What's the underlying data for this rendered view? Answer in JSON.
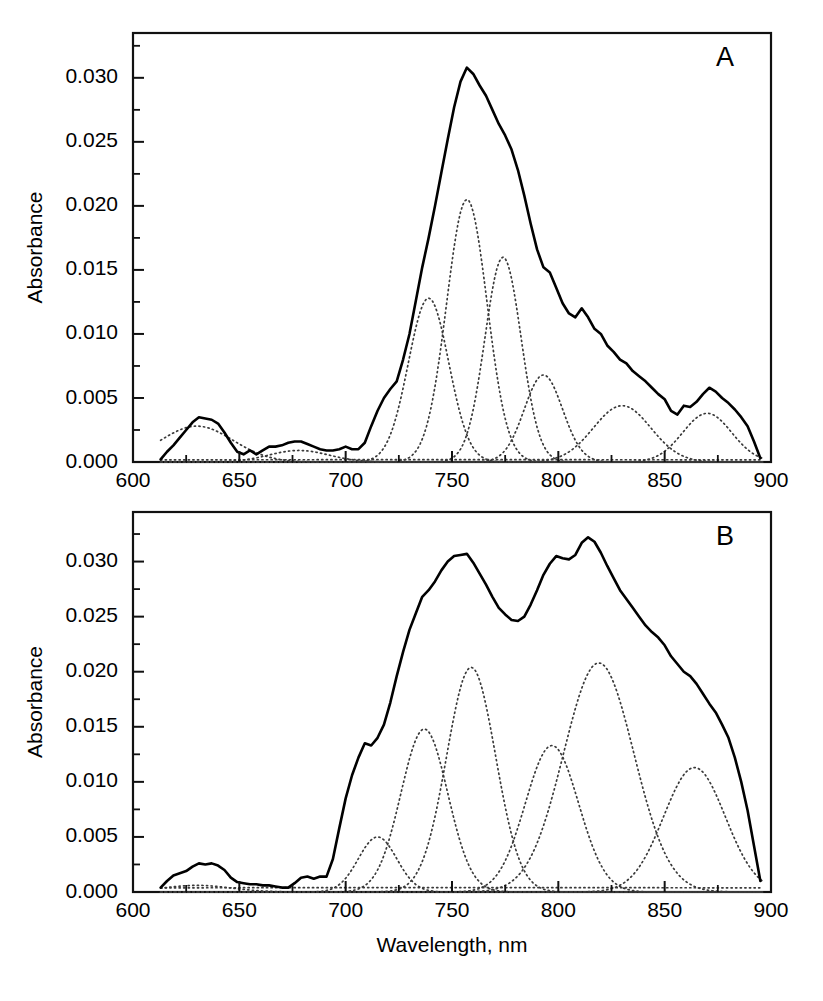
{
  "figure": {
    "background": "#ffffff",
    "width": 823,
    "height": 1001,
    "shared_xlabel": "Wavelength, nm",
    "shared_ylabel": "Absorbance"
  },
  "chart_data": [
    {
      "id": "panel-a",
      "type": "line",
      "title": "",
      "panel_label": "A",
      "xlabel": "",
      "ylabel": "Absorbance",
      "xlim": [
        600,
        900
      ],
      "ylim": [
        0.0,
        0.0335
      ],
      "grid": false,
      "legend": "none",
      "xticks": [
        600,
        650,
        700,
        750,
        800,
        850,
        900
      ],
      "xticklabels": [
        "600",
        "650",
        "700",
        "750",
        "800",
        "850",
        "900"
      ],
      "xminorticks": [
        625,
        675,
        725,
        775,
        825,
        875
      ],
      "yticks": [
        0.0,
        0.005,
        0.01,
        0.015,
        0.02,
        0.025,
        0.03
      ],
      "yticklabels": [
        "0.000",
        "0.005",
        "0.010",
        "0.015",
        "0.020",
        "0.025",
        "0.030"
      ],
      "yminorticks": [
        0.0025,
        0.0075,
        0.0125,
        0.0175,
        0.0225,
        0.0275,
        0.0325
      ],
      "series": [
        {
          "name": "measured spectrum",
          "style": "solid",
          "color": "#000000",
          "x": [
            613,
            616,
            619,
            622,
            625,
            628,
            631,
            634,
            637,
            640,
            643,
            646,
            649,
            652,
            655,
            658,
            661,
            664,
            667,
            670,
            673,
            676,
            679,
            682,
            685,
            688,
            691,
            694,
            697,
            700,
            703,
            706,
            709,
            712,
            715,
            718,
            721,
            724,
            727,
            730,
            733,
            736,
            739,
            742,
            745,
            748,
            751,
            754,
            757,
            760,
            763,
            766,
            769,
            772,
            775,
            778,
            781,
            784,
            787,
            790,
            793,
            796,
            799,
            802,
            805,
            808,
            811,
            814,
            817,
            820,
            823,
            826,
            829,
            832,
            835,
            838,
            841,
            844,
            847,
            850,
            853,
            856,
            859,
            862,
            865,
            868,
            871,
            874,
            877,
            880,
            883,
            886,
            889,
            892,
            895
          ],
          "y": [
            0.0002,
            0.0008,
            0.0013,
            0.0019,
            0.0025,
            0.0031,
            0.0035,
            0.0034,
            0.0033,
            0.003,
            0.0023,
            0.0015,
            0.0008,
            0.0006,
            0.0009,
            0.0006,
            0.0009,
            0.0012,
            0.0012,
            0.0013,
            0.0015,
            0.0016,
            0.0016,
            0.0014,
            0.0012,
            0.001,
            0.0009,
            0.0009,
            0.001,
            0.0012,
            0.001,
            0.001,
            0.0015,
            0.0028,
            0.004,
            0.005,
            0.0057,
            0.0063,
            0.008,
            0.01,
            0.0126,
            0.0152,
            0.0175,
            0.02,
            0.0226,
            0.0252,
            0.0277,
            0.0297,
            0.0308,
            0.0303,
            0.0294,
            0.0286,
            0.0275,
            0.0264,
            0.0255,
            0.0244,
            0.0228,
            0.0208,
            0.0186,
            0.0166,
            0.0152,
            0.0148,
            0.0136,
            0.0124,
            0.0116,
            0.0113,
            0.012,
            0.0113,
            0.0104,
            0.01,
            0.0091,
            0.0086,
            0.008,
            0.0077,
            0.0071,
            0.0067,
            0.0063,
            0.0058,
            0.0053,
            0.0049,
            0.004,
            0.0037,
            0.0044,
            0.0043,
            0.0047,
            0.0053,
            0.0058,
            0.0055,
            0.005,
            0.0046,
            0.0041,
            0.0035,
            0.0028,
            0.0016,
            0.0003
          ]
        }
      ],
      "components": [
        {
          "name": "band-630",
          "center": 630,
          "amplitude": 0.0028,
          "width_nm": 17,
          "style": "dotted"
        },
        {
          "name": "band-678",
          "center": 678,
          "amplitude": 0.0009,
          "width_nm": 14,
          "style": "dotted"
        },
        {
          "name": "band-739",
          "center": 739,
          "amplitude": 0.0128,
          "width_nm": 9.5,
          "style": "dotted"
        },
        {
          "name": "band-757",
          "center": 757,
          "amplitude": 0.0205,
          "width_nm": 9.5,
          "style": "dotted"
        },
        {
          "name": "band-774",
          "center": 774,
          "amplitude": 0.016,
          "width_nm": 8.5,
          "style": "dotted"
        },
        {
          "name": "band-793",
          "center": 793,
          "amplitude": 0.0068,
          "width_nm": 9.0,
          "style": "dotted"
        },
        {
          "name": "band-830",
          "center": 830,
          "amplitude": 0.0044,
          "width_nm": 13.5,
          "style": "dotted"
        },
        {
          "name": "band-870",
          "center": 870,
          "amplitude": 0.0038,
          "width_nm": 11.5,
          "style": "dotted"
        },
        {
          "name": "baseline",
          "center": 750,
          "amplitude": 0.00018,
          "width_nm": 400,
          "style": "dotted"
        }
      ]
    },
    {
      "id": "panel-b",
      "type": "line",
      "title": "",
      "panel_label": "B",
      "xlabel": "Wavelength, nm",
      "ylabel": "Absorbance",
      "xlim": [
        600,
        900
      ],
      "ylim": [
        0.0,
        0.0345
      ],
      "grid": false,
      "legend": "none",
      "xticks": [
        600,
        650,
        700,
        750,
        800,
        850,
        900
      ],
      "xticklabels": [
        "600",
        "650",
        "700",
        "750",
        "800",
        "850",
        "900"
      ],
      "xminorticks": [
        625,
        675,
        725,
        775,
        825,
        875
      ],
      "yticks": [
        0.0,
        0.005,
        0.01,
        0.015,
        0.02,
        0.025,
        0.03
      ],
      "yticklabels": [
        "0.000",
        "0.005",
        "0.010",
        "0.015",
        "0.020",
        "0.025",
        "0.030"
      ],
      "yminorticks": [
        0.0025,
        0.0075,
        0.0125,
        0.0175,
        0.0225,
        0.0275,
        0.0325
      ],
      "series": [
        {
          "name": "measured spectrum",
          "style": "solid",
          "color": "#000000",
          "x": [
            613,
            616,
            619,
            622,
            625,
            628,
            631,
            634,
            637,
            640,
            643,
            646,
            649,
            652,
            655,
            658,
            661,
            664,
            667,
            670,
            673,
            676,
            679,
            682,
            685,
            688,
            691,
            694,
            697,
            700,
            703,
            706,
            709,
            712,
            715,
            718,
            721,
            724,
            727,
            730,
            733,
            736,
            739,
            742,
            745,
            748,
            751,
            754,
            757,
            760,
            763,
            766,
            769,
            772,
            775,
            778,
            781,
            784,
            787,
            790,
            793,
            796,
            799,
            802,
            805,
            808,
            811,
            814,
            817,
            820,
            823,
            826,
            829,
            832,
            835,
            838,
            841,
            844,
            847,
            850,
            853,
            856,
            859,
            862,
            865,
            868,
            871,
            874,
            877,
            880,
            883,
            886,
            889,
            892,
            895
          ],
          "y": [
            0.0004,
            0.001,
            0.0015,
            0.0017,
            0.0019,
            0.0023,
            0.0026,
            0.0025,
            0.0026,
            0.0024,
            0.002,
            0.0013,
            0.0009,
            0.0008,
            0.0007,
            0.0007,
            0.0006,
            0.0006,
            0.0005,
            0.0004,
            0.0004,
            0.0008,
            0.0013,
            0.0014,
            0.0012,
            0.0014,
            0.0014,
            0.003,
            0.0058,
            0.0085,
            0.0106,
            0.0122,
            0.0135,
            0.0133,
            0.014,
            0.0152,
            0.0172,
            0.0196,
            0.0218,
            0.0238,
            0.0253,
            0.0268,
            0.0274,
            0.0282,
            0.0292,
            0.03,
            0.0305,
            0.0306,
            0.0307,
            0.0299,
            0.0289,
            0.0279,
            0.0268,
            0.0258,
            0.0252,
            0.0247,
            0.0246,
            0.025,
            0.0261,
            0.0274,
            0.0288,
            0.0298,
            0.0305,
            0.0303,
            0.0302,
            0.0306,
            0.0317,
            0.0322,
            0.0318,
            0.0308,
            0.0296,
            0.0285,
            0.0274,
            0.0266,
            0.0258,
            0.025,
            0.0242,
            0.0236,
            0.0231,
            0.0224,
            0.0214,
            0.0207,
            0.02,
            0.0196,
            0.0189,
            0.018,
            0.0171,
            0.0163,
            0.0152,
            0.014,
            0.0122,
            0.01,
            0.0074,
            0.0042,
            0.001
          ]
        }
      ],
      "components": [
        {
          "name": "band-630",
          "center": 630,
          "amplitude": 0.0006,
          "width_nm": 16,
          "style": "dotted"
        },
        {
          "name": "band-715",
          "center": 715,
          "amplitude": 0.005,
          "width_nm": 9,
          "style": "dotted"
        },
        {
          "name": "band-737",
          "center": 737,
          "amplitude": 0.0148,
          "width_nm": 11,
          "style": "dotted"
        },
        {
          "name": "band-759",
          "center": 759,
          "amplitude": 0.0204,
          "width_nm": 11.5,
          "style": "dotted"
        },
        {
          "name": "band-797",
          "center": 797,
          "amplitude": 0.0133,
          "width_nm": 12.5,
          "style": "dotted"
        },
        {
          "name": "band-819",
          "center": 819,
          "amplitude": 0.0208,
          "width_nm": 16.5,
          "style": "dotted"
        },
        {
          "name": "band-864",
          "center": 864,
          "amplitude": 0.0113,
          "width_nm": 14.5,
          "style": "dotted"
        },
        {
          "name": "baseline",
          "center": 750,
          "amplitude": 0.0004,
          "width_nm": 400,
          "style": "dotted"
        }
      ]
    }
  ]
}
